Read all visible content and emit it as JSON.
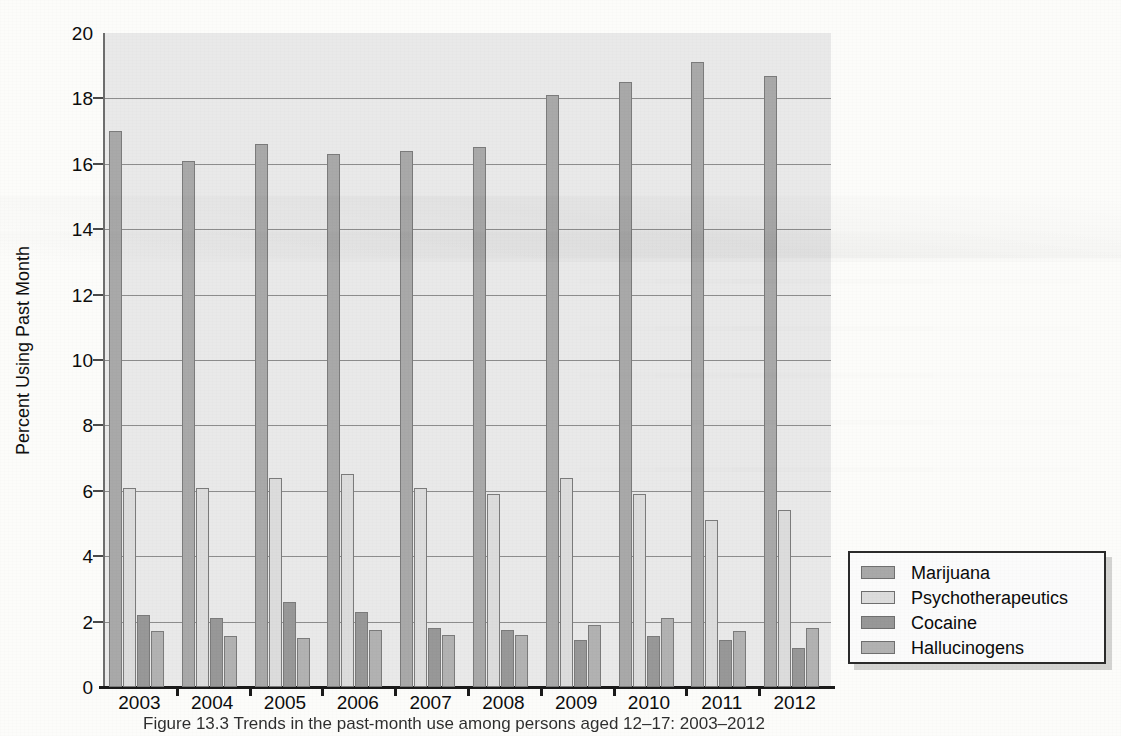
{
  "figure": {
    "caption": "Figure 13.3  Trends in the past-month use among persons aged 12–17: 2003–2012"
  },
  "chart_data": {
    "type": "bar",
    "title": "",
    "subtitle": "",
    "xlabel": "",
    "ylabel": "Percent Using Past Month",
    "categories": [
      "2003",
      "2004",
      "2005",
      "2006",
      "2007",
      "2008",
      "2009",
      "2010",
      "2011",
      "2012"
    ],
    "series": [
      {
        "name": "Marijuana",
        "color": "#a9a9a9",
        "values": [
          17.0,
          16.1,
          16.6,
          16.3,
          16.4,
          16.5,
          18.1,
          18.5,
          19.1,
          18.7
        ]
      },
      {
        "name": "Psychotherapeutics",
        "color": "#dcdcdc",
        "values": [
          6.1,
          6.1,
          6.4,
          6.5,
          6.1,
          5.9,
          6.4,
          5.9,
          5.1,
          5.4
        ]
      },
      {
        "name": "Cocaine",
        "color": "#989898",
        "values": [
          2.2,
          2.1,
          2.6,
          2.3,
          1.8,
          1.75,
          1.45,
          1.55,
          1.45,
          1.2
        ]
      },
      {
        "name": "Hallucinogens",
        "color": "#b2b2b2",
        "values": [
          1.7,
          1.55,
          1.5,
          1.75,
          1.6,
          1.6,
          1.9,
          2.1,
          1.7,
          1.8
        ]
      }
    ],
    "ylim": [
      0,
      20
    ],
    "ytick_step": 2,
    "yticks": [
      "0",
      "2",
      "4",
      "6",
      "8",
      "10",
      "12",
      "14",
      "16",
      "18",
      "20"
    ],
    "grid": true,
    "grid_axis": "y",
    "legend_position": "bottom-right",
    "plot_background": "#e9e9e9"
  }
}
